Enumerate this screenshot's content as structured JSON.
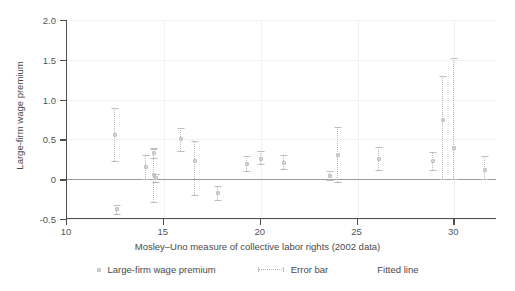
{
  "chart_data": {
    "type": "scatter",
    "title": "",
    "xlabel": "Mosley–Uno measure of collective labor rights (2002 data)",
    "ylabel": "Large-firm wage premium",
    "xlim": [
      10,
      32.2
    ],
    "ylim": [
      -0.5,
      2.0
    ],
    "xticks": [
      10,
      15,
      20,
      25,
      30
    ],
    "xtick_labels": [
      "10",
      "15",
      "20",
      "25",
      "30"
    ],
    "yticks": [
      -0.5,
      0,
      0.5,
      1.0,
      1.5,
      2.0
    ],
    "ytick_labels": [
      "-0.5",
      "0",
      "0.5",
      "1.0",
      "1.5",
      "2.0"
    ],
    "grid": true,
    "legend_position": "bottom",
    "legend": [
      {
        "label": "Large-firm wage premium",
        "marker": "square"
      },
      {
        "label": "Error bar",
        "marker": "dotted-line-with-caps"
      },
      {
        "label": "Fitted line",
        "marker": "solid-line"
      }
    ],
    "fitted_line": {
      "type": "horizontal",
      "y": 0.0,
      "color": "#9a9a9a"
    },
    "point_color": "#d2d2d2",
    "errorbar_color": "#b9b9b9",
    "points": [
      {
        "x": 12.5,
        "y": 0.56,
        "lo": 0.23,
        "hi": 0.89
      },
      {
        "x": 12.6,
        "y": -0.38,
        "lo": -0.44,
        "hi": -0.32
      },
      {
        "x": 14.1,
        "y": 0.15,
        "lo": 0.0,
        "hi": 0.31
      },
      {
        "x": 14.5,
        "y": 0.05,
        "lo": -0.29,
        "hi": 0.38
      },
      {
        "x": 14.5,
        "y": 0.33,
        "lo": 0.27,
        "hi": 0.39
      },
      {
        "x": 14.6,
        "y": 0.02,
        "lo": -0.03,
        "hi": 0.07
      },
      {
        "x": 15.9,
        "y": 0.51,
        "lo": 0.36,
        "hi": 0.64
      },
      {
        "x": 16.6,
        "y": 0.23,
        "lo": -0.2,
        "hi": 0.48
      },
      {
        "x": 17.8,
        "y": -0.17,
        "lo": -0.26,
        "hi": -0.08
      },
      {
        "x": 19.3,
        "y": 0.19,
        "lo": 0.1,
        "hi": 0.29
      },
      {
        "x": 20.0,
        "y": 0.26,
        "lo": 0.19,
        "hi": 0.36
      },
      {
        "x": 21.2,
        "y": 0.2,
        "lo": 0.13,
        "hi": 0.3
      },
      {
        "x": 23.6,
        "y": 0.04,
        "lo": -0.01,
        "hi": 0.1
      },
      {
        "x": 24.0,
        "y": 0.3,
        "lo": -0.04,
        "hi": 0.66
      },
      {
        "x": 26.1,
        "y": 0.25,
        "lo": 0.12,
        "hi": 0.4
      },
      {
        "x": 28.9,
        "y": 0.23,
        "lo": 0.12,
        "hi": 0.34
      },
      {
        "x": 29.4,
        "y": 0.75,
        "lo": 0.0,
        "hi": 1.3
      },
      {
        "x": 30.0,
        "y": 0.39,
        "lo": 0.0,
        "hi": 1.52
      },
      {
        "x": 31.6,
        "y": 0.12,
        "lo": 0.0,
        "hi": 0.29
      }
    ]
  }
}
